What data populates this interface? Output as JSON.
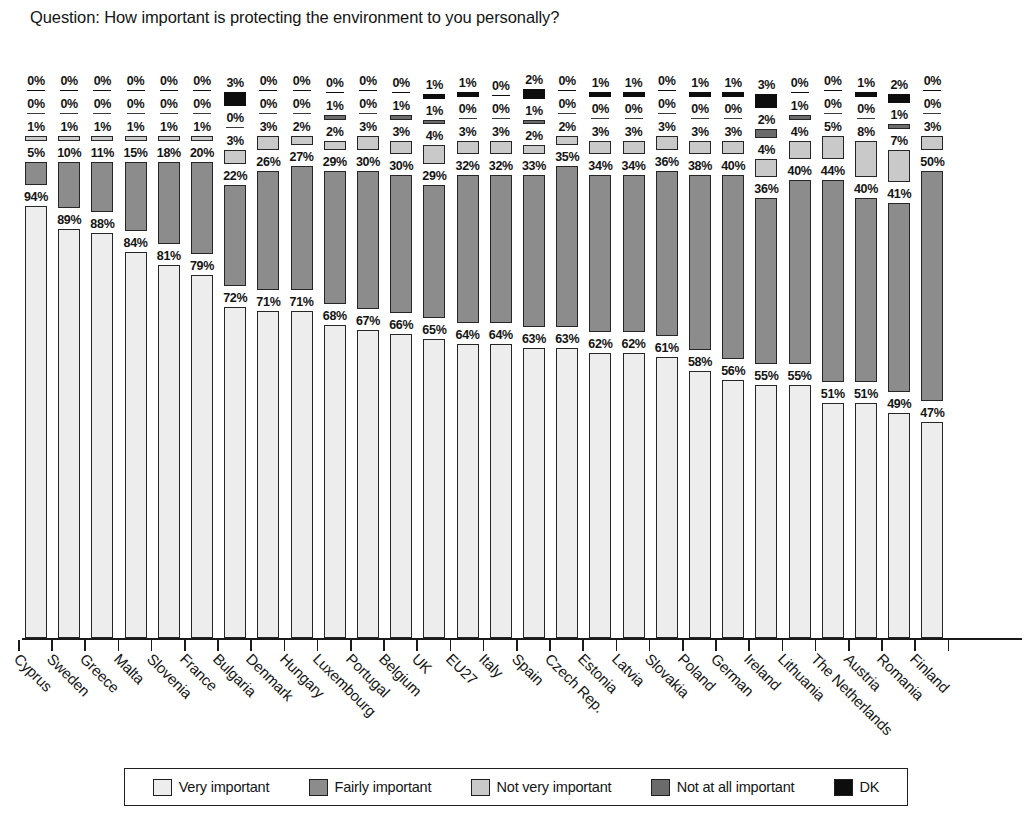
{
  "title": "Question: How important is protecting the environment to you personally?",
  "legend": {
    "items": [
      {
        "label": "Very important",
        "color": "#ededed"
      },
      {
        "label": "Fairly important",
        "color": "#8c8c8c"
      },
      {
        "label": "Not very important",
        "color": "#c9c9c9"
      },
      {
        "label": "Not at all important",
        "color": "#6b6b6b"
      },
      {
        "label": "DK",
        "color": "#0d0d0d"
      }
    ]
  },
  "chart_data": {
    "type": "bar",
    "title": "Question: How important is protecting the environment to you personally?",
    "xlabel": "",
    "ylabel": "",
    "ylim": [
      0,
      100
    ],
    "grid": false,
    "legend_position": "bottom",
    "stacked": false,
    "note": "Grouped per country: each country shows 5 separate bars stacked vertically in the plot, drawn bottom-up in the order Very / Fairly / Not very / Not at all / DK, each with its own percentage data label.",
    "categories": [
      "Cyprus",
      "Sweden",
      "Greece",
      "Malta",
      "Slovenia",
      "France",
      "Bulgaria",
      "Denmark",
      "Hungary",
      "Luxembourg",
      "Portugal",
      "Belgium",
      "UK",
      "EU27",
      "Italy",
      "Spain",
      "Czech Rep.",
      "Estonia",
      "Latvia",
      "Slovakia",
      "Poland",
      "German",
      "Ireland",
      "Lithuania",
      "The Netherlands",
      "Austria",
      "Romania",
      "Finland"
    ],
    "series": [
      {
        "name": "Very important",
        "color": "#ededed",
        "values": [
          94,
          89,
          88,
          84,
          81,
          79,
          72,
          71,
          71,
          68,
          67,
          66,
          65,
          64,
          64,
          63,
          63,
          62,
          62,
          61,
          58,
          56,
          55,
          55,
          51,
          51,
          49,
          47
        ]
      },
      {
        "name": "Fairly important",
        "color": "#8c8c8c",
        "values": [
          5,
          10,
          11,
          15,
          18,
          20,
          22,
          26,
          27,
          29,
          30,
          30,
          29,
          32,
          32,
          33,
          35,
          34,
          34,
          36,
          38,
          40,
          36,
          40,
          44,
          40,
          41,
          50
        ]
      },
      {
        "name": "Not very important",
        "color": "#c9c9c9",
        "values": [
          1,
          1,
          1,
          1,
          1,
          1,
          3,
          3,
          2,
          2,
          3,
          3,
          4,
          3,
          3,
          2,
          2,
          3,
          3,
          3,
          3,
          3,
          4,
          4,
          5,
          8,
          7,
          3
        ]
      },
      {
        "name": "Not at all important",
        "color": "#6b6b6b",
        "values": [
          0,
          0,
          0,
          0,
          0,
          0,
          0,
          0,
          0,
          1,
          0,
          1,
          1,
          0,
          0,
          1,
          0,
          0,
          0,
          0,
          0,
          0,
          2,
          1,
          0,
          0,
          1,
          0
        ]
      },
      {
        "name": "DK",
        "color": "#0d0d0d",
        "values": [
          0,
          0,
          0,
          0,
          0,
          0,
          3,
          0,
          0,
          0,
          0,
          0,
          1,
          1,
          0,
          2,
          0,
          1,
          1,
          0,
          1,
          1,
          3,
          0,
          0,
          1,
          2,
          0
        ]
      }
    ],
    "value_suffix": "%"
  }
}
